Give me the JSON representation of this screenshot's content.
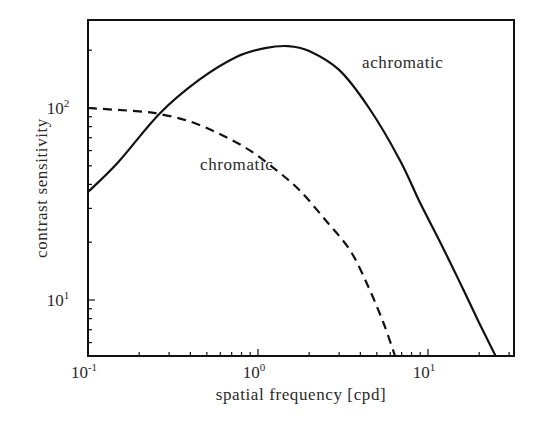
{
  "chart_data": {
    "type": "line",
    "title": "",
    "xlabel": "spatial frequency [cpd]",
    "ylabel": "contrast sensitivity",
    "xscale": "log",
    "yscale": "log",
    "xlim": [
      0.1,
      32
    ],
    "ylim": [
      5.1,
      287
    ],
    "grid": false,
    "legend": "none (inline curve labels)",
    "x_ticks": [
      {
        "value": 0.1,
        "label": "10",
        "exp": "-1"
      },
      {
        "value": 1,
        "label": "10",
        "exp": "0"
      },
      {
        "value": 10,
        "label": "10",
        "exp": "1"
      }
    ],
    "y_ticks": [
      {
        "value": 10,
        "label": "10",
        "exp": "1"
      },
      {
        "value": 100,
        "label": "10",
        "exp": "2"
      }
    ],
    "series": [
      {
        "name": "achromatic",
        "style": "solid",
        "x": [
          0.1,
          0.15,
          0.265,
          0.45,
          0.75,
          1.1,
          1.5,
          2.0,
          3.0,
          4.5,
          6.8,
          9.0,
          11.8,
          16,
          20,
          25
        ],
        "y": [
          36.5,
          52,
          94,
          140,
          185,
          205,
          210,
          198,
          158,
          100,
          54,
          32,
          20,
          11.5,
          7.6,
          5.1
        ]
      },
      {
        "name": "chromatic",
        "style": "dashed",
        "x": [
          0.1,
          0.2,
          0.265,
          0.4,
          0.6,
          0.9,
          1.3,
          1.77,
          2.5,
          3.5,
          4.5,
          5.5,
          6.4
        ],
        "y": [
          100,
          96,
          93,
          85,
          73,
          60,
          47,
          37,
          26,
          18,
          11.5,
          7.5,
          5.1
        ]
      }
    ],
    "annotations": [
      {
        "text": "achromatic",
        "x": 7.0,
        "y": 200
      },
      {
        "text": "chromatic",
        "x": 1.25,
        "y": 55
      }
    ]
  }
}
